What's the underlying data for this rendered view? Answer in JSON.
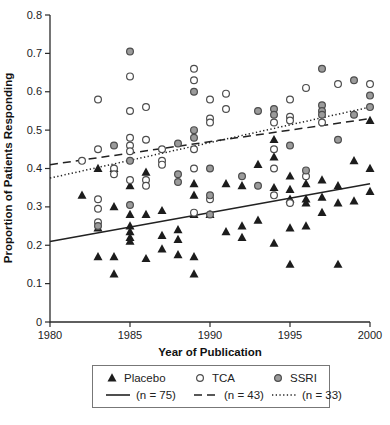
{
  "chart_data": {
    "type": "scatter",
    "title": "",
    "xlabel": "Year of Publication",
    "ylabel": "Proportion of Patients Responding",
    "xlim": [
      1980,
      2000
    ],
    "ylim": [
      0,
      0.8
    ],
    "grid": false,
    "legend_position": "bottom",
    "x_ticks": [
      {
        "v": 1980,
        "label": "1980"
      },
      {
        "v": 1985,
        "label": "1985"
      },
      {
        "v": 1990,
        "label": "1990"
      },
      {
        "v": 1995,
        "label": "1995"
      },
      {
        "v": 2000,
        "label": "2000"
      }
    ],
    "y_ticks": [
      {
        "v": 0,
        "label": "0"
      },
      {
        "v": 0.1,
        "label": "0.1"
      },
      {
        "v": 0.2,
        "label": "0.2"
      },
      {
        "v": 0.3,
        "label": "0.3"
      },
      {
        "v": 0.4,
        "label": "0.4"
      },
      {
        "v": 0.5,
        "label": "0.5"
      },
      {
        "v": 0.6,
        "label": "0.6"
      },
      {
        "v": 0.7,
        "label": "0.7"
      },
      {
        "v": 0.8,
        "label": "0.8"
      }
    ],
    "colors": {
      "placebo": "#1c1c1c",
      "tca_fill": "#ffffff",
      "ssri_fill": "#9b9b9b",
      "marker_stroke": "#4d4d4d",
      "axis": "#2b2b2b",
      "line": "#222222"
    },
    "series": [
      {
        "name": "Placebo",
        "marker": "filled-triangle",
        "trend": {
          "style": "solid",
          "x": [
            1980,
            2000
          ],
          "y": [
            0.21,
            0.36
          ],
          "label": "(n = 75)"
        },
        "points": [
          [
            1982,
            0.33
          ],
          [
            1983,
            0.4
          ],
          [
            1983,
            0.245
          ],
          [
            1983,
            0.17
          ],
          [
            1984,
            0.4
          ],
          [
            1984,
            0.3
          ],
          [
            1984,
            0.17
          ],
          [
            1984,
            0.125
          ],
          [
            1985,
            0.355
          ],
          [
            1985,
            0.28
          ],
          [
            1985,
            0.25
          ],
          [
            1985,
            0.235
          ],
          [
            1985,
            0.22
          ],
          [
            1985,
            0.21
          ],
          [
            1986,
            0.39
          ],
          [
            1986,
            0.28
          ],
          [
            1986,
            0.165
          ],
          [
            1987,
            0.29
          ],
          [
            1987,
            0.225
          ],
          [
            1987,
            0.19
          ],
          [
            1988,
            0.24
          ],
          [
            1988,
            0.215
          ],
          [
            1988,
            0.175
          ],
          [
            1989,
            0.36
          ],
          [
            1989,
            0.33
          ],
          [
            1989,
            0.28
          ],
          [
            1989,
            0.17
          ],
          [
            1989,
            0.125
          ],
          [
            1990,
            0.28
          ],
          [
            1991,
            0.36
          ],
          [
            1991,
            0.235
          ],
          [
            1992,
            0.355
          ],
          [
            1992,
            0.25
          ],
          [
            1992,
            0.22
          ],
          [
            1993,
            0.41
          ],
          [
            1993,
            0.265
          ],
          [
            1994,
            0.475
          ],
          [
            1994,
            0.43
          ],
          [
            1994,
            0.35
          ],
          [
            1994,
            0.205
          ],
          [
            1995,
            0.38
          ],
          [
            1995,
            0.345
          ],
          [
            1995,
            0.32
          ],
          [
            1995,
            0.245
          ],
          [
            1995,
            0.15
          ],
          [
            1996,
            0.36
          ],
          [
            1996,
            0.32
          ],
          [
            1996,
            0.31
          ],
          [
            1996,
            0.25
          ],
          [
            1997,
            0.37
          ],
          [
            1997,
            0.325
          ],
          [
            1997,
            0.285
          ],
          [
            1998,
            0.355
          ],
          [
            1998,
            0.31
          ],
          [
            1998,
            0.15
          ],
          [
            1999,
            0.42
          ],
          [
            1999,
            0.315
          ],
          [
            2000,
            0.525
          ],
          [
            2000,
            0.4
          ],
          [
            2000,
            0.34
          ]
        ]
      },
      {
        "name": "TCA",
        "marker": "open-circle",
        "trend": {
          "style": "dashed",
          "x": [
            1980,
            2000
          ],
          "y": [
            0.41,
            0.53
          ],
          "label": "(n = 43)"
        },
        "points": [
          [
            1982,
            0.42
          ],
          [
            1983,
            0.58
          ],
          [
            1983,
            0.45
          ],
          [
            1983,
            0.32
          ],
          [
            1983,
            0.295
          ],
          [
            1983,
            0.26
          ],
          [
            1984,
            0.4
          ],
          [
            1984,
            0.385
          ],
          [
            1985,
            0.64
          ],
          [
            1985,
            0.55
          ],
          [
            1985,
            0.48
          ],
          [
            1985,
            0.46
          ],
          [
            1985,
            0.445
          ],
          [
            1985,
            0.37
          ],
          [
            1986,
            0.56
          ],
          [
            1986,
            0.475
          ],
          [
            1986,
            0.37
          ],
          [
            1986,
            0.355
          ],
          [
            1987,
            0.45
          ],
          [
            1987,
            0.42
          ],
          [
            1987,
            0.41
          ],
          [
            1989,
            0.66
          ],
          [
            1989,
            0.63
          ],
          [
            1989,
            0.45
          ],
          [
            1989,
            0.4
          ],
          [
            1989,
            0.285
          ],
          [
            1990,
            0.58
          ],
          [
            1990,
            0.53
          ],
          [
            1990,
            0.52
          ],
          [
            1990,
            0.32
          ],
          [
            1991,
            0.595
          ],
          [
            1991,
            0.555
          ],
          [
            1994,
            0.52
          ],
          [
            1994,
            0.45
          ],
          [
            1994,
            0.4
          ],
          [
            1994,
            0.33
          ],
          [
            1995,
            0.58
          ],
          [
            1995,
            0.535
          ],
          [
            1995,
            0.525
          ],
          [
            1995,
            0.31
          ],
          [
            1996,
            0.61
          ],
          [
            1996,
            0.38
          ],
          [
            1997,
            0.52
          ],
          [
            1998,
            0.62
          ],
          [
            2000,
            0.62
          ]
        ]
      },
      {
        "name": "SSRI",
        "marker": "gray-circle",
        "trend": {
          "style": "dotted",
          "x": [
            1980,
            2000
          ],
          "y": [
            0.375,
            0.56
          ],
          "label": "(n = 33)"
        },
        "points": [
          [
            1983,
            0.25
          ],
          [
            1984,
            0.46
          ],
          [
            1985,
            0.705
          ],
          [
            1985,
            0.42
          ],
          [
            1985,
            0.305
          ],
          [
            1988,
            0.465
          ],
          [
            1988,
            0.385
          ],
          [
            1988,
            0.365
          ],
          [
            1989,
            0.6
          ],
          [
            1989,
            0.5
          ],
          [
            1989,
            0.48
          ],
          [
            1990,
            0.4
          ],
          [
            1990,
            0.33
          ],
          [
            1990,
            0.28
          ],
          [
            1992,
            0.38
          ],
          [
            1993,
            0.55
          ],
          [
            1993,
            0.355
          ],
          [
            1994,
            0.555
          ],
          [
            1994,
            0.54
          ],
          [
            1995,
            0.46
          ],
          [
            1996,
            0.395
          ],
          [
            1997,
            0.66
          ],
          [
            1997,
            0.565
          ],
          [
            1997,
            0.55
          ],
          [
            1997,
            0.54
          ],
          [
            1998,
            0.475
          ],
          [
            1999,
            0.63
          ],
          [
            1999,
            0.54
          ],
          [
            2000,
            0.59
          ],
          [
            2000,
            0.56
          ]
        ]
      }
    ]
  }
}
